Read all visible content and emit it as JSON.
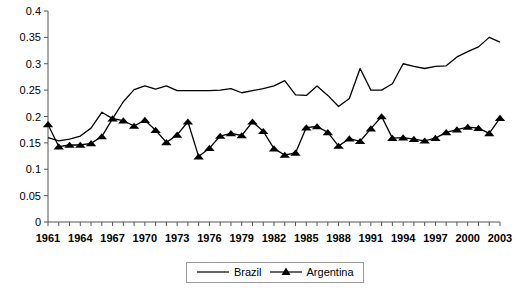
{
  "chart_data": {
    "type": "line",
    "title": "",
    "xlabel": "",
    "ylabel": "",
    "xlim": [
      1961,
      2003
    ],
    "ylim": [
      0,
      0.4
    ],
    "grid": false,
    "legend_position": "bottom-center",
    "y_ticks": [
      "0",
      "0.05",
      "0.1",
      "0.15",
      "0.2",
      "0.25",
      "0.3",
      "0.35",
      "0.4"
    ],
    "y_tick_values": [
      0,
      0.05,
      0.1,
      0.15,
      0.2,
      0.25,
      0.3,
      0.35,
      0.4
    ],
    "x_tick_labels": [
      "1961",
      "1964",
      "1967",
      "1970",
      "1973",
      "1976",
      "1979",
      "1982",
      "1985",
      "1988",
      "1991",
      "1994",
      "1997",
      "2000",
      "2003"
    ],
    "x": [
      1961,
      1962,
      1963,
      1964,
      1965,
      1966,
      1967,
      1968,
      1969,
      1970,
      1971,
      1972,
      1973,
      1974,
      1975,
      1976,
      1977,
      1978,
      1979,
      1980,
      1981,
      1982,
      1983,
      1984,
      1985,
      1986,
      1987,
      1988,
      1989,
      1990,
      1991,
      1992,
      1993,
      1994,
      1995,
      1996,
      1997,
      1998,
      1999,
      2000,
      2001,
      2002,
      2003
    ],
    "series": [
      {
        "name": "Brazil",
        "marker": "none",
        "color": "#000000",
        "values": [
          0.16,
          0.154,
          0.157,
          0.163,
          0.178,
          0.208,
          0.196,
          0.228,
          0.251,
          0.258,
          0.252,
          0.258,
          0.249,
          0.249,
          0.249,
          0.249,
          0.25,
          0.253,
          0.245,
          0.249,
          0.253,
          0.258,
          0.268,
          0.241,
          0.24,
          0.258,
          0.24,
          0.219,
          0.234,
          0.291,
          0.25,
          0.25,
          0.262,
          0.3,
          0.295,
          0.291,
          0.295,
          0.296,
          0.313,
          0.323,
          0.332,
          0.35,
          0.341
        ]
      },
      {
        "name": "Argentina",
        "marker": "triangle",
        "color": "#000000",
        "values": [
          0.185,
          0.143,
          0.146,
          0.146,
          0.149,
          0.162,
          0.196,
          0.192,
          0.182,
          0.193,
          0.174,
          0.151,
          0.165,
          0.19,
          0.124,
          0.14,
          0.163,
          0.168,
          0.164,
          0.19,
          0.172,
          0.139,
          0.127,
          0.131,
          0.179,
          0.181,
          0.17,
          0.144,
          0.158,
          0.153,
          0.177,
          0.2,
          0.159,
          0.16,
          0.157,
          0.154,
          0.159,
          0.17,
          0.175,
          0.18,
          0.178,
          0.168,
          0.197
        ]
      }
    ]
  },
  "legend": {
    "items": [
      {
        "label": "Brazil",
        "marker": "line"
      },
      {
        "label": "Argentina",
        "marker": "triangle"
      }
    ]
  }
}
